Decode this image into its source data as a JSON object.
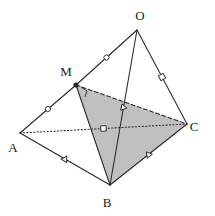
{
  "figure": {
    "background": "#ffffff",
    "stroke_color": "#262626",
    "shade_color": "#b5b5b5",
    "shade_opacity": 0.85,
    "vertices": [
      {
        "id": "O",
        "label": "O",
        "x": 137,
        "y": 30,
        "label_x": 140,
        "label_y": 20,
        "dot": false
      },
      {
        "id": "M",
        "label": "M",
        "x": 76,
        "y": 85,
        "label_x": 66,
        "label_y": 76,
        "dot": true
      },
      {
        "id": "A",
        "label": "A",
        "x": 20,
        "y": 133,
        "label_x": 13,
        "label_y": 152,
        "dot": false
      },
      {
        "id": "B",
        "label": "B",
        "x": 110,
        "y": 185,
        "label_x": 107,
        "label_y": 207,
        "dot": false
      },
      {
        "id": "C",
        "label": "C",
        "x": 187,
        "y": 124,
        "label_x": 194,
        "label_y": 131,
        "dot": false
      }
    ],
    "edges": [
      {
        "id": "OM",
        "from": "O",
        "to": "M",
        "style": "solid",
        "tick": "circle"
      },
      {
        "id": "MA",
        "from": "M",
        "to": "A",
        "style": "solid",
        "tick": "circle"
      },
      {
        "id": "AB",
        "from": "A",
        "to": "B",
        "style": "solid",
        "tick": "triangle"
      },
      {
        "id": "BC",
        "from": "B",
        "to": "C",
        "style": "solid",
        "tick": "triangle"
      },
      {
        "id": "OB",
        "from": "O",
        "to": "B",
        "style": "solid",
        "tick": "triangle"
      },
      {
        "id": "OC",
        "from": "O",
        "to": "C",
        "style": "solid",
        "tick": "square"
      },
      {
        "id": "AC",
        "from": "A",
        "to": "C",
        "style": "dotted",
        "tick": "square"
      },
      {
        "id": "MB",
        "from": "M",
        "to": "B",
        "style": "solid",
        "tick": "none"
      },
      {
        "id": "MC",
        "from": "M",
        "to": "C",
        "style": "dashed",
        "tick": "none"
      }
    ],
    "shaded_faces": [
      {
        "id": "MBC",
        "vertices": [
          "M",
          "B",
          "C"
        ]
      }
    ],
    "angle_marks": [
      {
        "id": "right-angle-at-M",
        "vertex": "M",
        "type": "right-angle"
      }
    ]
  }
}
